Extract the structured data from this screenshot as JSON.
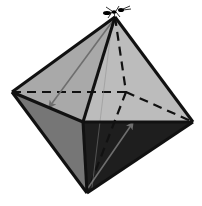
{
  "diagram": {
    "vertices": {
      "top": [
        115,
        17
      ],
      "left": [
        12,
        92
      ],
      "right": [
        193,
        122
      ],
      "front": [
        83,
        122
      ],
      "bottom": [
        87,
        193
      ],
      "back": [
        126,
        92
      ]
    },
    "colors": {
      "background": "#ffffff",
      "face_top_left": "#a9a9a9",
      "face_top_right": "#bcbcbc",
      "face_bottom_left": "#767676",
      "face_bottom_right": "#1e1e1e",
      "edge": "#111111",
      "hidden_edge": "#111111",
      "arrow": "#6e6e6e",
      "ant": "#000000"
    },
    "arrows": [
      {
        "name": "arrow-top-to-left-front",
        "from": [
          112,
          22
        ],
        "to": [
          50,
          108
        ]
      },
      {
        "name": "arrow-bottom-to-right",
        "from": [
          88,
          188
        ],
        "to": [
          134,
          122
        ]
      }
    ]
  }
}
